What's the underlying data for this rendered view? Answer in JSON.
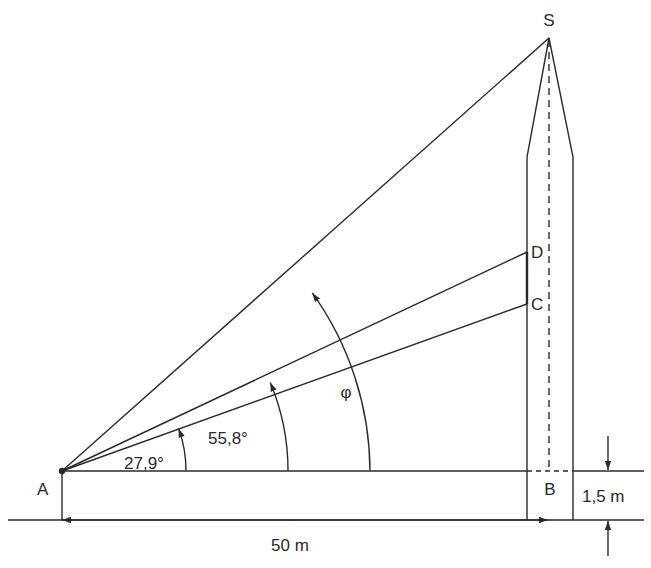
{
  "diagram": {
    "type": "trigonometry-height-measurement",
    "points": {
      "A": {
        "label": "A"
      },
      "B": {
        "label": "B"
      },
      "C": {
        "label": "C"
      },
      "D": {
        "label": "D"
      },
      "S": {
        "label": "S"
      }
    },
    "angles": {
      "alpha": {
        "label": "27,9°"
      },
      "beta": {
        "label": "55,8°"
      },
      "phi": {
        "label": "φ"
      }
    },
    "dimensions": {
      "horizontal_distance": {
        "label": "50 m"
      },
      "eye_height": {
        "label": "1,5 m"
      }
    },
    "colors": {
      "line": "#2a2a2a",
      "background": "#ffffff"
    }
  }
}
